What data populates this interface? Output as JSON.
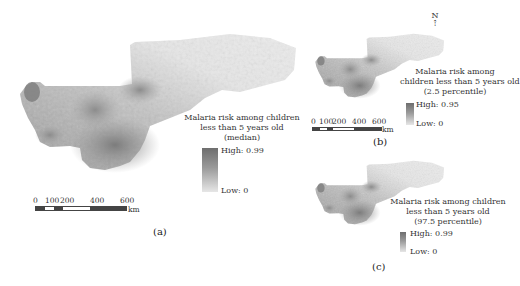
{
  "figure": {
    "panels": [
      {
        "id": "a",
        "caption": "(a)",
        "legend": {
          "title_lines": [
            "Malaria risk among children",
            "less than 5 years old",
            "(median)"
          ],
          "high_label": "High: 0.99",
          "low_label": "Low: 0"
        },
        "scale_bar": {
          "ticks": [
            "0",
            "100",
            "200",
            "400",
            "600"
          ],
          "unit": "km"
        }
      },
      {
        "id": "b",
        "caption": "(b)",
        "north_arrow": "N",
        "legend": {
          "title_lines": [
            "Malaria risk among",
            "children less than 5 years old",
            "(2.5 percentile)"
          ],
          "high_label": "High: 0.95",
          "low_label": "Low: 0"
        },
        "scale_bar": {
          "ticks": [
            "0",
            "100",
            "200",
            "400",
            "600"
          ],
          "unit": "km"
        }
      },
      {
        "id": "c",
        "caption": "(c)",
        "legend": {
          "title_lines": [
            "Malaria risk among children",
            "less than 5 years old",
            "(97.5 percentile)"
          ],
          "high_label": "High: 0.99",
          "low_label": "Low: 0"
        }
      }
    ],
    "colors": {
      "high": "#6e6e6e",
      "low": "#e6e6e6",
      "map_light": "#e8e8e8",
      "map_dark": "#7a7a7a"
    }
  }
}
